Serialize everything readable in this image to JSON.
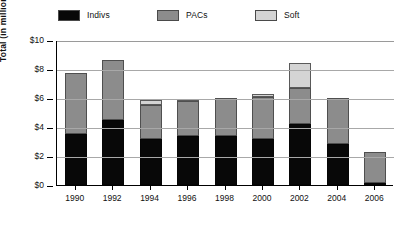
{
  "chart_data": {
    "type": "bar",
    "subtype": "stacked-bar",
    "title": "",
    "xlabel": "",
    "ylabel": "Total (in millions)",
    "categories": [
      "1990",
      "1992",
      "1994",
      "1996",
      "1998",
      "2000",
      "2002",
      "2004",
      "2006"
    ],
    "series": [
      {
        "name": "Indivs",
        "color": "#080808",
        "values": [
          3.5,
          4.5,
          3.2,
          3.4,
          3.4,
          3.2,
          4.2,
          2.8,
          0.15
        ]
      },
      {
        "name": "PACs",
        "color": "#8c8c8c",
        "values": [
          4.2,
          4.1,
          2.3,
          2.4,
          2.6,
          2.9,
          2.5,
          3.2,
          2.15
        ]
      },
      {
        "name": "Soft",
        "color": "#d4d4d4",
        "values": [
          0.0,
          0.0,
          0.35,
          0.1,
          0.0,
          0.15,
          1.7,
          0.0,
          0.0
        ]
      }
    ],
    "totals": [
      7.7,
      8.6,
      5.85,
      5.9,
      6.0,
      6.25,
      8.4,
      6.0,
      2.3
    ],
    "ylim": [
      0,
      10
    ],
    "yticks": [
      0,
      2,
      4,
      6,
      8,
      10
    ],
    "ytick_labels": [
      "$0",
      "$2",
      "$4",
      "$6",
      "$8",
      "$10"
    ],
    "grid": true,
    "grid_axis": "y",
    "legend_position": "top"
  },
  "legend": {
    "items": [
      {
        "label": "Indivs",
        "swatch": "#080808"
      },
      {
        "label": "PACs",
        "swatch": "#8c8c8c"
      },
      {
        "label": "Soft",
        "swatch": "#d4d4d4"
      }
    ]
  },
  "axes": {
    "y": {
      "title": "Total (in millions)",
      "tick_labels": [
        "$10",
        "$8",
        "$6",
        "$4",
        "$2",
        "$0"
      ]
    },
    "x": {
      "tick_labels": [
        "1990",
        "1992",
        "1994",
        "1996",
        "1998",
        "2000",
        "2002",
        "2004",
        "2006"
      ]
    }
  }
}
